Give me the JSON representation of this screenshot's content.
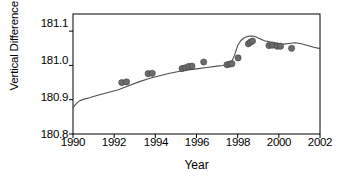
{
  "chart_data": {
    "type": "scatter",
    "title": "",
    "xlabel": "Year",
    "ylabel": "Vertical Difference (m)",
    "xlim": [
      1990,
      2002
    ],
    "ylim": [
      180.8,
      181.15
    ],
    "xticks": [
      1990,
      1992,
      1994,
      1996,
      1998,
      2000,
      2002
    ],
    "xtick_labels": [
      "1990",
      "1992",
      "1994",
      "1996",
      "1998",
      "2000",
      "2002"
    ],
    "yticks": [
      180.8,
      180.9,
      181.0,
      181.1
    ],
    "ytick_labels": [
      "180.8",
      "180.9",
      "181.0",
      "181.1"
    ],
    "grid": false,
    "legend": null,
    "series": [
      {
        "name": "model line",
        "type": "line",
        "color": "#4d4d4d",
        "x": [
          1990.0,
          1990.15,
          1990.3,
          1990.5,
          1990.8,
          1991.2,
          1991.7,
          1992.2,
          1992.7,
          1993.2,
          1993.7,
          1994.2,
          1994.7,
          1995.2,
          1995.6,
          1996.0,
          1996.5,
          1997.0,
          1997.3,
          1997.55,
          1997.7,
          1997.85,
          1998.0,
          1998.15,
          1998.3,
          1998.45,
          1998.6,
          1998.8,
          1999.0,
          1999.3,
          1999.6,
          1999.9,
          2000.2,
          2000.5,
          2000.8,
          2001.1,
          2001.4,
          2001.7,
          2002.0
        ],
        "y": [
          180.877,
          180.888,
          180.896,
          180.901,
          180.906,
          180.913,
          180.921,
          180.929,
          180.941,
          180.952,
          180.962,
          180.97,
          180.977,
          180.983,
          180.987,
          180.99,
          180.994,
          180.998,
          181.0,
          181.003,
          181.01,
          181.03,
          181.058,
          181.072,
          181.08,
          181.084,
          181.086,
          181.085,
          181.08,
          181.072,
          181.068,
          181.065,
          181.062,
          181.064,
          181.066,
          181.063,
          181.058,
          181.053,
          181.049
        ]
      },
      {
        "name": "observations",
        "type": "scatter",
        "color": "#6b6b6b",
        "marker": "circle",
        "points": [
          {
            "x": 1992.37,
            "y": 180.95
          },
          {
            "x": 1992.6,
            "y": 180.952
          },
          {
            "x": 1993.65,
            "y": 180.976
          },
          {
            "x": 1993.85,
            "y": 180.977
          },
          {
            "x": 1995.3,
            "y": 180.991
          },
          {
            "x": 1995.45,
            "y": 180.993
          },
          {
            "x": 1995.62,
            "y": 180.997
          },
          {
            "x": 1995.78,
            "y": 180.998
          },
          {
            "x": 1996.35,
            "y": 181.01
          },
          {
            "x": 1997.48,
            "y": 181.002
          },
          {
            "x": 1997.62,
            "y": 181.004
          },
          {
            "x": 1997.72,
            "y": 181.005
          },
          {
            "x": 1998.02,
            "y": 181.022
          },
          {
            "x": 1998.52,
            "y": 181.063
          },
          {
            "x": 1998.62,
            "y": 181.068
          },
          {
            "x": 1998.72,
            "y": 181.071
          },
          {
            "x": 1999.52,
            "y": 181.058
          },
          {
            "x": 1999.68,
            "y": 181.059
          },
          {
            "x": 1999.92,
            "y": 181.056
          },
          {
            "x": 2000.08,
            "y": 181.056
          },
          {
            "x": 2000.62,
            "y": 181.05
          }
        ]
      }
    ]
  }
}
